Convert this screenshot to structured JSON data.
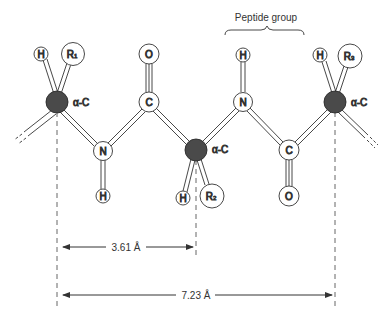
{
  "title": "Peptide group",
  "colors": {
    "alpha_carbon": "#4a4a4a",
    "atom_fill": "#ffffff",
    "stroke": "#333333",
    "dash": "#555555"
  },
  "labels": {
    "alpha_c": "α-C",
    "H": "H",
    "N": "N",
    "C": "C",
    "O": "O",
    "R": "R",
    "r1_sub": "1",
    "r2_sub": "2",
    "r3_sub": "3"
  },
  "atoms": [
    {
      "id": "alpha-c-1",
      "label": "α-C",
      "type": "alpha-carbon"
    },
    {
      "id": "h-alpha-1",
      "label": "H"
    },
    {
      "id": "r1",
      "label": "R1"
    },
    {
      "id": "n-1",
      "label": "N"
    },
    {
      "id": "h-n-1",
      "label": "H"
    },
    {
      "id": "c-1",
      "label": "C"
    },
    {
      "id": "o-1",
      "label": "O"
    },
    {
      "id": "alpha-c-2",
      "label": "α-C",
      "type": "alpha-carbon"
    },
    {
      "id": "h-alpha-2",
      "label": "H"
    },
    {
      "id": "r2",
      "label": "R2"
    },
    {
      "id": "n-2",
      "label": "N"
    },
    {
      "id": "h-n-2",
      "label": "H"
    },
    {
      "id": "c-2",
      "label": "C"
    },
    {
      "id": "o-2",
      "label": "O"
    },
    {
      "id": "alpha-c-3",
      "label": "α-C",
      "type": "alpha-carbon"
    },
    {
      "id": "h-alpha-3",
      "label": "H"
    },
    {
      "id": "r3",
      "label": "R3"
    }
  ],
  "dimensions": {
    "short": "3.61 Å",
    "long": "7.23 Å"
  }
}
